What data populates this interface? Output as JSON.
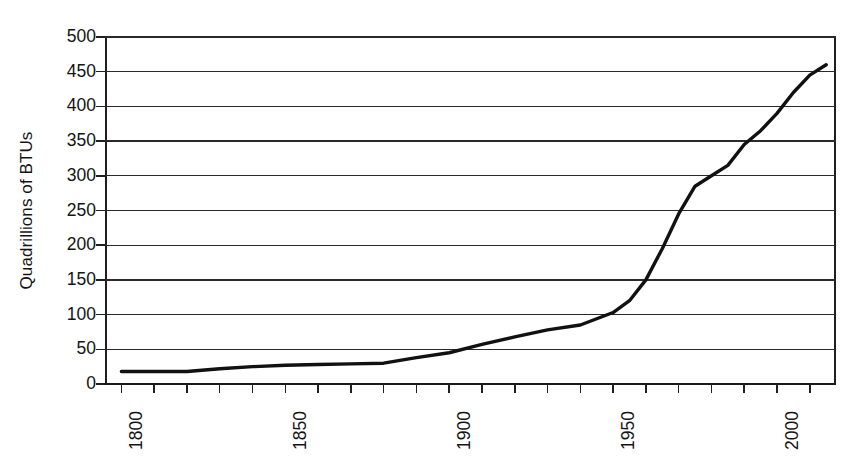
{
  "chart_data": {
    "type": "line",
    "title": "",
    "xlabel": "",
    "ylabel": "Quadrillions of BTUs",
    "xlim": [
      1795,
      2018
    ],
    "ylim": [
      0,
      500
    ],
    "grid": true,
    "legend": "none",
    "y_ticks": [
      0,
      50,
      100,
      150,
      200,
      250,
      300,
      350,
      400,
      450,
      500
    ],
    "y_tick_labels": [
      "0",
      "50",
      "100",
      "150",
      "200",
      "250",
      "300",
      "350",
      "400",
      "450",
      "500"
    ],
    "x_tick_labels": [
      "1800",
      "1850",
      "1900",
      "1950",
      "2000"
    ],
    "x_tick_label_values": [
      1800,
      1850,
      1900,
      1950,
      2000
    ],
    "x_minor_tick_interval": 10,
    "series": [
      {
        "name": "U.S. energy consumption",
        "x": [
          1800,
          1810,
          1820,
          1830,
          1840,
          1850,
          1860,
          1870,
          1880,
          1890,
          1900,
          1910,
          1920,
          1930,
          1940,
          1950,
          1955,
          1960,
          1965,
          1970,
          1975,
          1980,
          1985,
          1990,
          1995,
          2000,
          2005,
          2010,
          2015
        ],
        "values": [
          18,
          18,
          18,
          22,
          25,
          27,
          28,
          29,
          30,
          38,
          45,
          57,
          68,
          78,
          85,
          103,
          120,
          150,
          195,
          245,
          285,
          300,
          315,
          345,
          365,
          390,
          420,
          445,
          460
        ]
      }
    ]
  },
  "axis": {
    "y_title": "Quadrillions of BTUs"
  },
  "style": {
    "line_color": "#111111",
    "grid_color": "#2a2a2a",
    "axis_color": "#1f1f1f",
    "background": "#ffffff",
    "text_color": "#141414"
  }
}
